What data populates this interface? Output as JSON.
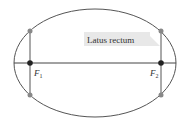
{
  "diagram": {
    "type": "ellipse-latus-rectum",
    "callout_label": "Latus rectum",
    "focus1_label": "F",
    "focus1_sub": "1",
    "focus2_label": "F",
    "focus2_sub": "2",
    "colors": {
      "ellipse_stroke": "#555555",
      "axis": "#444444",
      "focus_point": "#222222",
      "endpoint": "#888888",
      "callout_bg": "#e8e8e8"
    }
  }
}
